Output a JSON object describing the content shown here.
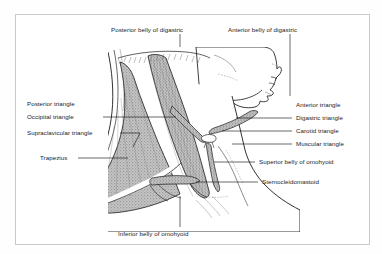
{
  "figure": {
    "border_color": "#c9c9c9",
    "background": "#ffffff",
    "ink_color": "#1b1b1b",
    "muscle_fill": "#b9b9b9",
    "skin_fill": "#ffffff"
  },
  "labels": {
    "top": [
      {
        "id": "posterior-belly-of-digastric",
        "text": "Posterior belly of digastric"
      },
      {
        "id": "anterior-belly-of-digastric",
        "text": "Anterior belly of digastric"
      }
    ],
    "left": [
      {
        "id": "posterior-triangle",
        "text": "Posterior triangle"
      },
      {
        "id": "occipital-triangle",
        "text": "Occipital triangle"
      },
      {
        "id": "supraclavicular-triangle",
        "text": "Supraclavicular triangle"
      },
      {
        "id": "trapezius",
        "text": "Trapezius"
      }
    ],
    "right": [
      {
        "id": "anterior-triangle",
        "text": "Anterior triangle"
      },
      {
        "id": "digastric-triangle",
        "text": "Digastric triangle"
      },
      {
        "id": "carotid-triangle",
        "text": "Carotid triangle"
      },
      {
        "id": "muscular-triangle",
        "text": "Muscular triangle"
      },
      {
        "id": "superior-belly-of-omohyoid",
        "text": "Superior belly of omohyoid"
      },
      {
        "id": "sternocleidomastoid",
        "text": "Sternocleidomastoid"
      }
    ],
    "bottom": [
      {
        "id": "inferior-belly-of-omohyoid",
        "text": "Inferior belly of omohyoid"
      }
    ]
  },
  "anatomy": {
    "regions": [
      "head-profile",
      "neck-outline",
      "trapezius-muscle",
      "sternocleidomastoid-muscle",
      "omohyoid-superior-belly",
      "omohyoid-inferior-belly",
      "digastric-muscle",
      "clavicle",
      "shoulder"
    ]
  }
}
